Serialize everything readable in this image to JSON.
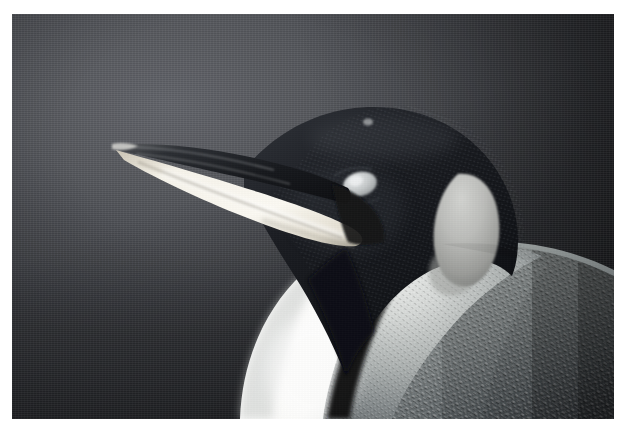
{
  "page": {
    "background_color": "#ffffff",
    "width": 626,
    "height": 433
  },
  "photo": {
    "frame": {
      "left": 12,
      "top": 14,
      "width": 602,
      "height": 405
    },
    "subject_name": "king-penguin",
    "view": "head and upper breast, facing left in profile",
    "colors": {
      "backdrop_light": "#62646a",
      "backdrop_mid": "#4e5055",
      "backdrop_dark": "#32343a",
      "head_black": "#14161a",
      "head_black_soft": "#22252b",
      "beak_upper_dark": "#1b1d21",
      "beak_stripe": "#f2efe6",
      "beak_stripe_shadow": "#cdc7b8",
      "eye_patch": "#cfd2d4",
      "auricular_patch": "#b8b9b6",
      "auricular_patch_shadow": "#8d8e8c",
      "breast_white": "#fbfbfa",
      "breast_shadow": "#d4d6d6",
      "nape_gray": "#9aa0a0",
      "back_gray": "#6e7475",
      "back_gray_dark": "#3c4043",
      "neck_divider": "#0d0e11"
    },
    "regions": [
      {
        "name": "backdrop",
        "description": "out-of-focus dark slate gray studio background, brightest upper-left of center, vignetted dark at corners"
      },
      {
        "name": "beak",
        "description": "long slender bill pointing to the upper left; dark upper mandible with a broad glossy cream-white mandibular plate below"
      },
      {
        "name": "crown",
        "description": "rounded black head cap"
      },
      {
        "name": "eye",
        "description": "small pale gray oval highlight on the side of the face"
      },
      {
        "name": "auricular-patch",
        "description": "large teardrop ear patch on the side of the head, pale cream gray"
      },
      {
        "name": "throat",
        "description": "dark black throat wedge meeting the pale breast"
      },
      {
        "name": "neck-divider",
        "description": "dark curved line separating white breast from the feathered flank"
      },
      {
        "name": "breast",
        "description": "bright white curved breast in the lower left of the frame"
      },
      {
        "name": "back",
        "description": "densely feathered gray flank and back filling the lower right, darkening toward the right edge"
      }
    ]
  }
}
